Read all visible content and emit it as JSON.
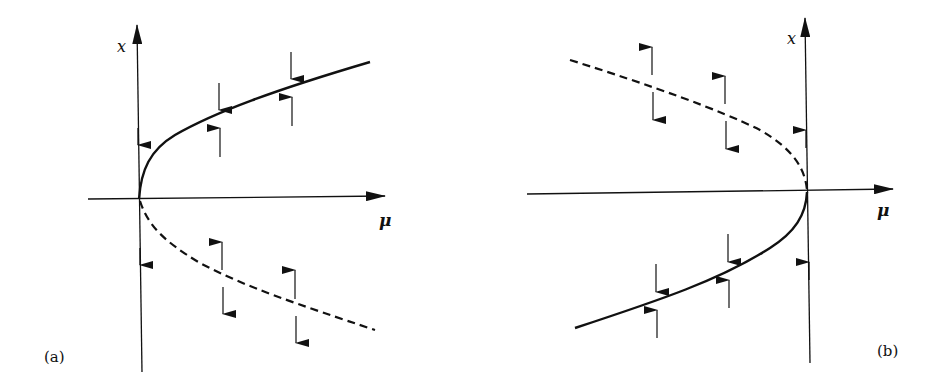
{
  "figure": {
    "stroke_color": "#111111",
    "background": "#ffffff"
  },
  "panels": [
    {
      "id": "a",
      "label": "(a)",
      "x_axis_label": "μ",
      "y_axis_label": "x",
      "stable_branch": "upper (solid), μ > 0",
      "unstable_branch": "lower (dashed), μ > 0",
      "axis_flow_arrows": [
        "down above branch",
        "down below origin"
      ]
    },
    {
      "id": "b",
      "label": "(b)",
      "x_axis_label": "μ",
      "y_axis_label": "x",
      "stable_branch": "lower (solid), μ < 0",
      "unstable_branch": "upper (dashed), μ < 0",
      "axis_flow_arrows": [
        "up above origin",
        "up below origin"
      ]
    }
  ]
}
